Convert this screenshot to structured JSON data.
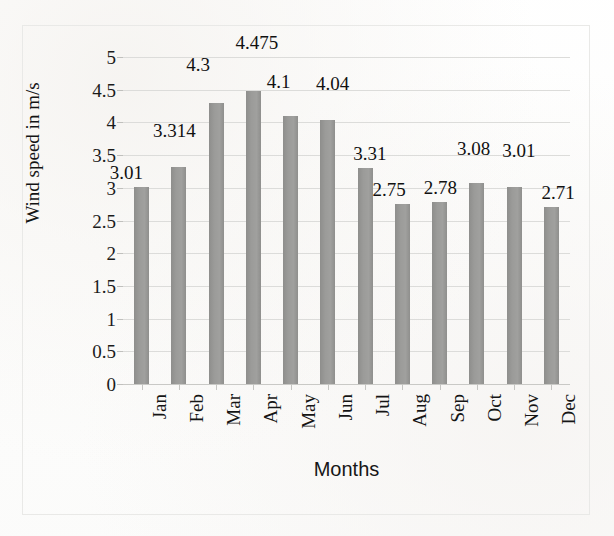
{
  "chart_data": {
    "type": "bar",
    "title": "",
    "xlabel": "Months",
    "ylabel": "Wind speed in m/s",
    "categories": [
      "Jan",
      "Feb",
      "Mar",
      "Apr",
      "May",
      "Jun",
      "Jul",
      "Aug",
      "Sep",
      "Oct",
      "Nov",
      "Dec"
    ],
    "values": [
      3.01,
      3.314,
      4.3,
      4.475,
      4.1,
      4.04,
      3.31,
      2.75,
      2.78,
      3.08,
      3.01,
      2.71
    ],
    "point_labels": [
      "3.01",
      "3.314",
      "4.3",
      "4.475",
      "4.1",
      "4.04",
      "3.31",
      "2.75",
      "2.78",
      "3.08",
      "3.01",
      "2.71"
    ],
    "ylim": [
      0,
      5
    ],
    "ytick_values": [
      0,
      0.5,
      1,
      1.5,
      2,
      2.5,
      3,
      3.5,
      4,
      4.5,
      5
    ],
    "ytick_labels": [
      "0",
      "0.5",
      "1",
      "1.5",
      "2",
      "2.5",
      "3",
      "3.5",
      "4",
      "4.5",
      "5"
    ],
    "grid": "horizontal",
    "legend": "none",
    "series_color": "#969694",
    "bar_color": "#969694"
  }
}
